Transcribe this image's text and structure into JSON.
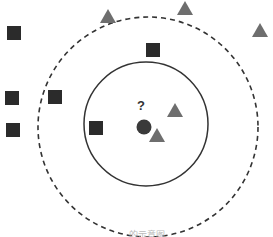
{
  "diagram": {
    "query_point": {
      "label": "?",
      "shape": "circle",
      "color": "#3a3a3a"
    },
    "classes": [
      {
        "name": "class-a",
        "shape": "square",
        "color": "#2b2b2b",
        "count": 6
      },
      {
        "name": "class-b",
        "shape": "triangle",
        "color": "#6e6e6e",
        "count": 5
      }
    ],
    "neighborhoods": [
      {
        "name": "inner-neighborhood",
        "style": "solid",
        "contains": {
          "squares": 1,
          "triangles": 2
        }
      },
      {
        "name": "outer-neighborhood",
        "style": "dashed",
        "contains": {
          "squares": 3,
          "triangles": 2
        }
      }
    ],
    "caption": "…… 的示意图"
  }
}
